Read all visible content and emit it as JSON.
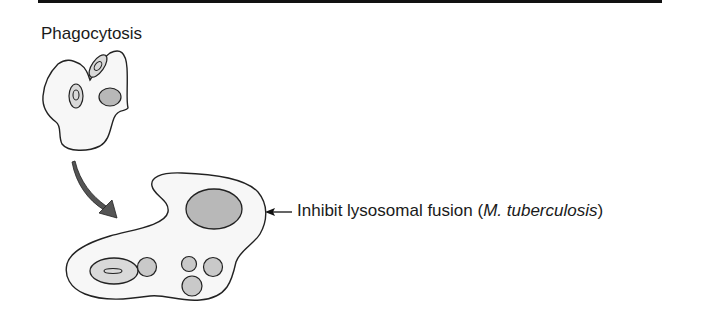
{
  "figure": {
    "title": "Phagocytosis",
    "annotation": {
      "prefix": "Inhibit lysosomal fusion (",
      "organism": "M. tuberculosis",
      "suffix": ")"
    }
  },
  "colors": {
    "rule": "#111111",
    "outline": "#222222",
    "cell_fill": "#f7f7f7",
    "vesicle_fill": "#d9d9d9",
    "lysosome_fill": "#b8b8b8",
    "arrow_fill": "#555555"
  },
  "icons": {
    "label_arrow": "left-arrow",
    "transition_arrow": "curved-down-arrow"
  }
}
